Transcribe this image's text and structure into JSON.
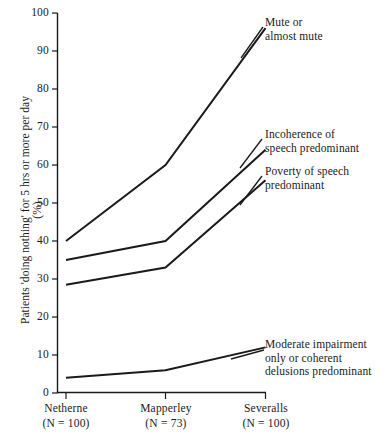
{
  "chart_data": {
    "type": "line",
    "title": "",
    "xlabel": "",
    "ylabel": "Patients 'doing nothing' for 5 hrs or more per day (%)",
    "categories": [
      "Netherne",
      "Mapperley",
      "Severalls"
    ],
    "category_sublabels": [
      "(N = 100)",
      "(N = 73)",
      "(N = 100)"
    ],
    "ylim": [
      0,
      100
    ],
    "ytick_values": [
      0,
      10,
      20,
      30,
      40,
      50,
      60,
      70,
      80,
      90,
      100
    ],
    "ytick_labels": [
      "0",
      "10",
      "20",
      "30",
      "40",
      "50",
      "60",
      "70",
      "80",
      "90",
      "100"
    ],
    "grid": false,
    "legend_position": "inline-annotations-right",
    "line_color": "#1a1a1a",
    "series": [
      {
        "name": "Mute or almost mute",
        "values": [
          40,
          60,
          96
        ]
      },
      {
        "name": "Incoherence of speech predominant",
        "values": [
          35,
          40,
          64
        ]
      },
      {
        "name": "Poverty of speech predominant",
        "values": [
          28.5,
          33,
          56
        ]
      },
      {
        "name": "Moderate impairment only or coherent delusions predominant",
        "values": [
          4,
          6,
          12
        ]
      }
    ],
    "annotations": [
      {
        "lines": [
          "Mute or",
          "almost mute"
        ]
      },
      {
        "lines": [
          "Incoherence of",
          "speech predominant"
        ]
      },
      {
        "lines": [
          "Poverty of speech",
          "predominant"
        ]
      },
      {
        "lines": [
          "Moderate impairment",
          "only or coherent",
          "delusions predominant"
        ]
      }
    ]
  }
}
